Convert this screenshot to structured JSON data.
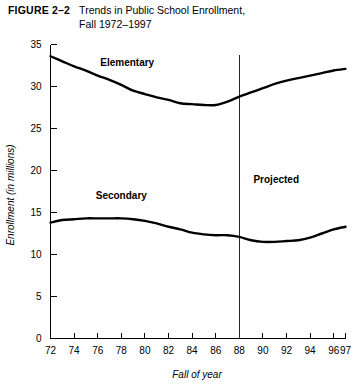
{
  "figure": {
    "label": "FIGURE 2–2",
    "title_line1": "Trends in Public School Enrollment,",
    "title_line2": "Fall 1972–1997"
  },
  "chart_data": {
    "type": "line",
    "title": "Trends in Public School Enrollment, Fall 1972–1997",
    "xlabel": "Fall of year",
    "ylabel": "Enrollment (in millions)",
    "xlim": [
      72,
      97
    ],
    "ylim": [
      0,
      35
    ],
    "grid": false,
    "legend_position": "inline-labels",
    "x_tick_labels": [
      "72",
      "74",
      "76",
      "78",
      "80",
      "82",
      "84",
      "86",
      "88",
      "90",
      "92",
      "94",
      "96",
      "97"
    ],
    "x_ticks": [
      72,
      74,
      76,
      78,
      80,
      82,
      84,
      86,
      88,
      90,
      92,
      94,
      96,
      97
    ],
    "y_ticks": [
      0,
      5,
      10,
      15,
      20,
      25,
      30,
      35
    ],
    "y_tick_labels": [
      "0",
      "5",
      "10",
      "15",
      "20",
      "25",
      "30",
      "35"
    ],
    "x": [
      72,
      73,
      74,
      75,
      76,
      77,
      78,
      79,
      80,
      81,
      82,
      83,
      84,
      85,
      86,
      87,
      88,
      89,
      90,
      91,
      92,
      93,
      94,
      95,
      96,
      97
    ],
    "series": [
      {
        "name": "Elementary",
        "values": [
          33.6,
          33.0,
          32.4,
          31.9,
          31.3,
          30.8,
          30.2,
          29.5,
          29.1,
          28.7,
          28.4,
          28.0,
          27.9,
          27.8,
          27.8,
          28.2,
          28.8,
          29.3,
          29.8,
          30.3,
          30.7,
          31.0,
          31.3,
          31.6,
          31.9,
          32.1
        ],
        "label_at": {
          "x": 78.5,
          "y": 32.5
        }
      },
      {
        "name": "Secondary",
        "values": [
          13.8,
          14.1,
          14.2,
          14.3,
          14.3,
          14.3,
          14.3,
          14.2,
          14.0,
          13.7,
          13.3,
          13.0,
          12.6,
          12.4,
          12.3,
          12.3,
          12.1,
          11.7,
          11.5,
          11.5,
          11.6,
          11.7,
          12.0,
          12.5,
          13.0,
          13.3
        ],
        "label_at": {
          "x": 78.0,
          "y": 16.6
        }
      }
    ],
    "annotations": [
      {
        "name": "projected",
        "text": "Projected",
        "divider_x": 88,
        "label_x": 89.2,
        "label_y": 18.5
      }
    ]
  }
}
